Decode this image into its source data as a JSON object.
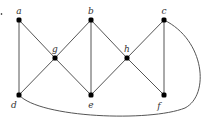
{
  "diagram": {
    "type": "graph",
    "marker": {
      "x": 1,
      "y": 14
    },
    "nodes": [
      {
        "id": "a",
        "label": "a",
        "x": 19,
        "y": 20,
        "lx": 19,
        "ly": 13
      },
      {
        "id": "b",
        "label": "b",
        "x": 91,
        "y": 20,
        "lx": 91,
        "ly": 13
      },
      {
        "id": "c",
        "label": "c",
        "x": 164,
        "y": 20,
        "lx": 164,
        "ly": 13
      },
      {
        "id": "g",
        "label": "g",
        "x": 55,
        "y": 58,
        "lx": 55,
        "ly": 51
      },
      {
        "id": "h",
        "label": "h",
        "x": 127,
        "y": 58,
        "lx": 127,
        "ly": 51
      },
      {
        "id": "d",
        "label": "d",
        "x": 19,
        "y": 95,
        "lx": 14,
        "ly": 107
      },
      {
        "id": "e",
        "label": "e",
        "x": 91,
        "y": 95,
        "lx": 91,
        "ly": 108
      },
      {
        "id": "f",
        "label": "f",
        "x": 164,
        "y": 95,
        "lx": 159,
        "ly": 108
      }
    ],
    "edges": [
      {
        "from": "a",
        "to": "d"
      },
      {
        "from": "a",
        "to": "g"
      },
      {
        "from": "g",
        "to": "b"
      },
      {
        "from": "g",
        "to": "d"
      },
      {
        "from": "g",
        "to": "e"
      },
      {
        "from": "b",
        "to": "e"
      },
      {
        "from": "b",
        "to": "h"
      },
      {
        "from": "h",
        "to": "e"
      },
      {
        "from": "h",
        "to": "c"
      },
      {
        "from": "h",
        "to": "f"
      },
      {
        "from": "c",
        "to": "f"
      },
      {
        "from": "d",
        "to": "c",
        "curved": true
      }
    ],
    "colors": {
      "edge": "#555555",
      "node": "#000000",
      "label": "#333333"
    }
  }
}
